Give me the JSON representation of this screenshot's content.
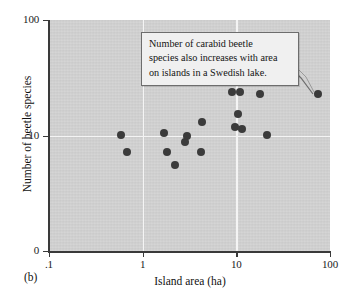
{
  "figure": {
    "panel_label": "(b)",
    "callout": {
      "lines": [
        "Number of carabid beetle",
        "species also increases with area",
        "on islands in a Swedish lake."
      ]
    }
  },
  "chart_data": {
    "type": "scatter",
    "title": "",
    "xlabel": "Island area (ha)",
    "ylabel": "Number of beetle species",
    "xscale": "log",
    "yscale": "log",
    "xlim": [
      0.1,
      100
    ],
    "ylim": [
      1,
      100
    ],
    "xticks": [
      0.1,
      1,
      10,
      100
    ],
    "xtick_labels": [
      ".1",
      "1",
      "10",
      "100"
    ],
    "yticks": [
      1,
      10,
      100
    ],
    "ytick_labels": [
      "0",
      "10",
      "100"
    ],
    "grid": true,
    "grid_color": "#f4f4f4",
    "legend": null,
    "marker_color": "#3b3b3b",
    "plot_background": "#d2d2d2",
    "points": [
      {
        "x": 0.58,
        "y": 10.2
      },
      {
        "x": 0.68,
        "y": 7.2
      },
      {
        "x": 1.7,
        "y": 10.6
      },
      {
        "x": 1.8,
        "y": 7.2
      },
      {
        "x": 2.2,
        "y": 5.6
      },
      {
        "x": 2.8,
        "y": 8.7
      },
      {
        "x": 3.0,
        "y": 10.0
      },
      {
        "x": 4.2,
        "y": 7.2
      },
      {
        "x": 4.3,
        "y": 13.0
      },
      {
        "x": 9.0,
        "y": 24.0
      },
      {
        "x": 9.6,
        "y": 11.8
      },
      {
        "x": 10.5,
        "y": 15.5
      },
      {
        "x": 11.0,
        "y": 24.0
      },
      {
        "x": 11.5,
        "y": 11.3
      },
      {
        "x": 18.0,
        "y": 23.0
      },
      {
        "x": 21.0,
        "y": 10.1
      },
      {
        "x": 75.0,
        "y": 23.0
      }
    ]
  }
}
